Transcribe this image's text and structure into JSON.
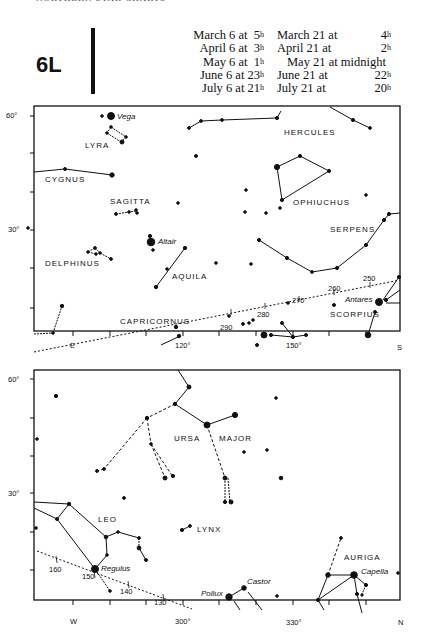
{
  "header": {
    "running_head": "NORTHERN STAR CHARTS",
    "chart_id": "6L",
    "times_left": [
      {
        "date": "March 6 at",
        "hour": "5",
        "unit": "h"
      },
      {
        "date": "April 6 at",
        "hour": "3",
        "unit": "h"
      },
      {
        "date": "May 6 at",
        "hour": "1",
        "unit": "h"
      },
      {
        "date": "June 6 at",
        "hour": "23",
        "unit": "h"
      },
      {
        "date": "July 6 at",
        "hour": "21",
        "unit": "h"
      }
    ],
    "times_right": [
      {
        "date": "March 21 at",
        "hour": "4",
        "unit": "h"
      },
      {
        "date": "April 21 at",
        "hour": "2",
        "unit": "h"
      },
      {
        "date": "May 21 at midnight",
        "hour": "",
        "unit": ""
      },
      {
        "date": "June 21 at",
        "hour": "22",
        "unit": "h"
      },
      {
        "date": "July 21 at",
        "hour": "20",
        "unit": "h"
      }
    ]
  },
  "upper_chart": {
    "y_labels": {
      "top": "60°",
      "mid": "30°"
    },
    "x_labels": {
      "e": "E",
      "a120": "120°",
      "a150": "150°",
      "s": "S"
    },
    "constellations": {
      "lyra": "LYRA",
      "cygnus": "CYGNUS",
      "sagitta": "SAGITTA",
      "delphinus": "DELPHINUS",
      "aquila": "AQUILA",
      "capricornus": "CAPRICORNUS",
      "hercules": "HERCULES",
      "ophiuchus": "OPHIUCHUS",
      "serpens": "SERPENS",
      "scorpius": "SCORPIUS"
    },
    "stars": {
      "vega": "Vega",
      "altair": "Altair",
      "antares": "Antares"
    },
    "ecliptic": {
      "e250": "250",
      "e260": "260",
      "e270": "270",
      "e280": "280",
      "e290": "290"
    }
  },
  "lower_chart": {
    "y_labels": {
      "top": "60°",
      "mid": "30°"
    },
    "x_labels": {
      "w": "W",
      "a300": "300°",
      "a330": "330°",
      "n": "N"
    },
    "constellations": {
      "ursa": "URSA",
      "major": "MAJOR",
      "leo": "LEO",
      "lynx": "LYNX",
      "auriga": "AURIGA"
    },
    "stars": {
      "regulus": "Regulus",
      "pollux": "Pollux",
      "castor": "Castor",
      "capella": "Capella"
    },
    "ecliptic": {
      "e160": "160",
      "e150": "150",
      "e140": "140",
      "e130": "130"
    }
  }
}
